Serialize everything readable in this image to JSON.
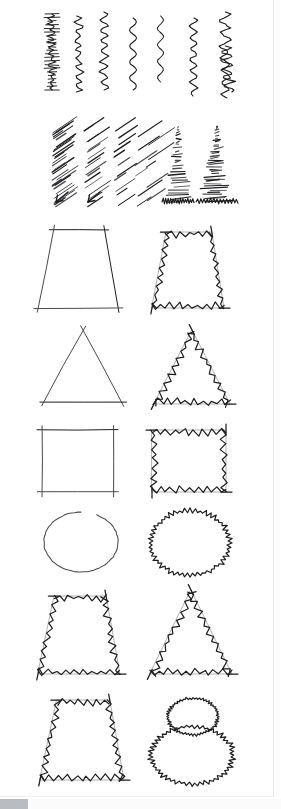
{
  "document": {
    "kind": "scanned-figure",
    "page_background": "#ffffff",
    "ink_color": "#1d1d1f",
    "soft_ink_color": "#4a4a4e",
    "rule_color": "#e7e8ea",
    "scrollbar_thumb_color": "#b9bcc0"
  },
  "viewer": {
    "scrollbar_present": true,
    "scrollbar_orientation": "horizontal",
    "scrollbar_position": "bottom-left"
  },
  "figure": {
    "title": "",
    "caption": "",
    "rows": [
      {
        "id": "row-squiggles",
        "name": "vertical-squiggle-strokes",
        "y_top": 8,
        "y_bottom": 105,
        "item_count": 7,
        "items": [
          {
            "name": "squiggle-stroke-1",
            "style": "dense-flat-zigzag",
            "x": 44,
            "y": 14,
            "w": 16,
            "h": 76,
            "amplitude": 7,
            "frequency": 26,
            "jaggedness": "high"
          },
          {
            "name": "squiggle-stroke-2",
            "style": "sharp-zigzag",
            "x": 70,
            "y": 16,
            "w": 17,
            "h": 76,
            "amplitude": 8,
            "frequency": 17,
            "jaggedness": "high"
          },
          {
            "name": "squiggle-stroke-3",
            "style": "rounded-zigzag",
            "x": 96,
            "y": 12,
            "w": 16,
            "h": 78,
            "amplitude": 8,
            "frequency": 15,
            "jaggedness": "medium"
          },
          {
            "name": "squiggle-stroke-4",
            "style": "smooth-wave",
            "x": 126,
            "y": 18,
            "w": 14,
            "h": 72,
            "amplitude": 7,
            "frequency": 9,
            "jaggedness": "none"
          },
          {
            "name": "squiggle-stroke-5",
            "style": "smooth-wave",
            "x": 154,
            "y": 16,
            "w": 13,
            "h": 66,
            "amplitude": 6,
            "frequency": 8,
            "jaggedness": "none"
          },
          {
            "name": "squiggle-stroke-6",
            "style": "fine-tremor-wave",
            "x": 186,
            "y": 18,
            "w": 15,
            "h": 78,
            "amplitude": 7,
            "frequency": 14,
            "jaggedness": "medium"
          },
          {
            "name": "squiggle-stroke-7",
            "style": "broken-tremor-wave",
            "x": 214,
            "y": 12,
            "w": 22,
            "h": 86,
            "amplitude": 9,
            "frequency": 14,
            "jaggedness": "high"
          }
        ]
      },
      {
        "id": "row-hatches",
        "name": "slanted-hatched-strokes",
        "y_top": 118,
        "y_bottom": 205,
        "item_count": 6,
        "items": [
          {
            "name": "hatch-stroke-1",
            "style": "dense-left-slant-hatch",
            "x": 54,
            "y": 122,
            "w": 18,
            "h": 78,
            "density": "very-high"
          },
          {
            "name": "hatch-stroke-2",
            "style": "loose-left-slant-hatch",
            "x": 86,
            "y": 122,
            "w": 16,
            "h": 78,
            "density": "medium"
          },
          {
            "name": "hatch-stroke-3",
            "style": "sparse-hatch",
            "x": 116,
            "y": 122,
            "w": 14,
            "h": 76,
            "density": "low"
          },
          {
            "name": "hatch-stroke-4",
            "style": "broken-hatch-pair",
            "x": 136,
            "y": 126,
            "w": 22,
            "h": 74,
            "density": "low"
          },
          {
            "name": "hatch-triangle-1",
            "style": "hatched-triangle",
            "x": 162,
            "y": 124,
            "w": 32,
            "h": 78,
            "density": "high"
          },
          {
            "name": "hatch-triangle-2",
            "style": "hatched-triangle",
            "x": 196,
            "y": 124,
            "w": 42,
            "h": 78,
            "density": "very-high"
          }
        ]
      },
      {
        "id": "row-trapezoid-1",
        "name": "trapezoid-pair-smooth-vs-jagged",
        "y_top": 222,
        "y_bottom": 315,
        "pair": [
          {
            "name": "trapezoid-smooth",
            "column": "left",
            "shape": "trapezoid",
            "variant": "smooth",
            "x": 38,
            "y": 230,
            "w": 80,
            "h": 78
          },
          {
            "name": "trapezoid-jagged",
            "column": "right",
            "shape": "trapezoid",
            "variant": "jagged",
            "x": 152,
            "y": 232,
            "w": 72,
            "h": 76
          }
        ]
      },
      {
        "id": "row-triangle-1",
        "name": "triangle-pair-smooth-vs-jagged",
        "y_top": 325,
        "y_bottom": 412,
        "pair": [
          {
            "name": "triangle-smooth",
            "column": "left",
            "shape": "triangle",
            "variant": "smooth",
            "x": 44,
            "y": 330,
            "w": 78,
            "h": 72
          },
          {
            "name": "triangle-jagged",
            "column": "right",
            "shape": "triangle",
            "variant": "jagged",
            "x": 154,
            "y": 330,
            "w": 76,
            "h": 74
          }
        ]
      },
      {
        "id": "row-square-1",
        "name": "square-pair-smooth-vs-jagged",
        "y_top": 420,
        "y_bottom": 500,
        "pair": [
          {
            "name": "square-smooth",
            "column": "left",
            "shape": "square",
            "variant": "smooth",
            "x": 42,
            "y": 430,
            "w": 72,
            "h": 62
          },
          {
            "name": "square-jagged",
            "column": "right",
            "shape": "square",
            "variant": "jagged",
            "x": 152,
            "y": 430,
            "w": 74,
            "h": 62
          }
        ]
      },
      {
        "id": "row-circle-1",
        "name": "circle-pair-smooth-vs-jagged",
        "y_top": 505,
        "y_bottom": 580,
        "pair": [
          {
            "name": "circle-smooth",
            "column": "left",
            "shape": "circle",
            "variant": "smooth",
            "x": 44,
            "y": 512,
            "w": 74,
            "h": 60
          },
          {
            "name": "circle-jagged",
            "column": "right",
            "shape": "circle",
            "variant": "jagged",
            "x": 152,
            "y": 512,
            "w": 76,
            "h": 62
          }
        ]
      },
      {
        "id": "row-trapezoid-triangle",
        "name": "trapezoid-and-triangle-jagged-pair",
        "y_top": 588,
        "y_bottom": 682,
        "pair": [
          {
            "name": "trapezoid-jagged-2",
            "column": "left",
            "shape": "trapezoid",
            "variant": "jagged",
            "x": 38,
            "y": 596,
            "w": 82,
            "h": 78
          },
          {
            "name": "triangle-jagged-2",
            "column": "right",
            "shape": "triangle",
            "variant": "jagged",
            "x": 150,
            "y": 590,
            "w": 82,
            "h": 84
          }
        ]
      },
      {
        "id": "row-trapezoid-snowman",
        "name": "trapezoid-and-double-circle-jagged-pair",
        "y_top": 692,
        "y_bottom": 790,
        "pair": [
          {
            "name": "trapezoid-jagged-3",
            "column": "left",
            "shape": "trapezoid",
            "variant": "jagged",
            "x": 40,
            "y": 700,
            "w": 84,
            "h": 80
          },
          {
            "name": "double-circle-jagged",
            "column": "right",
            "shape": "double-circle",
            "variant": "jagged",
            "x": 152,
            "y": 698,
            "w": 80,
            "h": 84
          }
        ]
      }
    ]
  }
}
